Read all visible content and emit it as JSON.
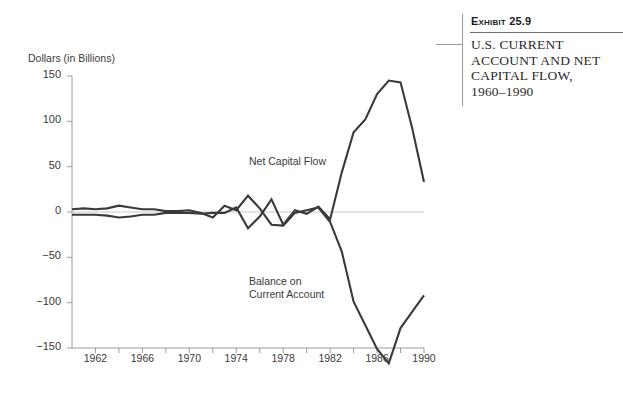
{
  "exhibit": {
    "number_prefix": "E",
    "number_rest": "XHIBIT",
    "number_label": "Exhibit 25.9",
    "title_line1": "U.S. CURRENT",
    "title_line2": "ACCOUNT AND NET",
    "title_line3": "CAPITAL FLOW,",
    "title_line4": "1960–1990"
  },
  "chart_data": {
    "type": "line",
    "xlabel": "",
    "ylabel": "Dollars (in Billions)",
    "ylim": [
      -150,
      150
    ],
    "xlim": [
      1960,
      1990
    ],
    "yticks": [
      150,
      100,
      50,
      0,
      -50,
      -100,
      -150
    ],
    "ytick_labels": [
      "150",
      "100",
      "50",
      "0",
      "−50",
      "−100",
      "−150"
    ],
    "xticks": [
      1962,
      1964,
      1966,
      1968,
      1970,
      1972,
      1974,
      1976,
      1978,
      1980,
      1982,
      1984,
      1986,
      1988,
      1990
    ],
    "xtick_labels_shown": [
      "1962",
      "1966",
      "1970",
      "1974",
      "1978",
      "1982",
      "1986",
      "1990"
    ],
    "xtick_labeled_years": [
      1962,
      1966,
      1970,
      1974,
      1978,
      1982,
      1986,
      1990
    ],
    "grid": false,
    "zero_line": true,
    "legend_position": "inline-annotations",
    "line_color": "#3a3a3a",
    "zero_line_color": "#c9c9c9",
    "axis_color": "#9a9a9a",
    "x": [
      1960,
      1961,
      1962,
      1963,
      1964,
      1965,
      1966,
      1967,
      1968,
      1969,
      1970,
      1971,
      1972,
      1973,
      1974,
      1975,
      1976,
      1977,
      1978,
      1979,
      1980,
      1981,
      1982,
      1983,
      1984,
      1985,
      1986,
      1987,
      1988,
      1989,
      1990
    ],
    "series": [
      {
        "name": "Net Capital Flow",
        "label": "Net Capital Flow",
        "values": [
          -3,
          -3,
          -3,
          -4,
          -6,
          -5,
          -3,
          -3,
          -1,
          -1,
          -1,
          -2,
          -1,
          -1,
          5,
          -18,
          -5,
          14,
          -14,
          2,
          -2,
          6,
          -8,
          44,
          88,
          102,
          130,
          145,
          143,
          92,
          33
        ]
      },
      {
        "name": "Balance on Current Account",
        "label": "Balance on\nCurrent Account",
        "values": [
          3,
          4,
          3,
          4,
          7,
          5,
          3,
          3,
          1,
          1,
          2,
          -1,
          -6,
          7,
          2,
          18,
          4,
          -14,
          -15,
          -1,
          2,
          5,
          -11,
          -44,
          -99,
          -125,
          -151,
          -167,
          -128,
          -110,
          -92
        ]
      }
    ]
  }
}
